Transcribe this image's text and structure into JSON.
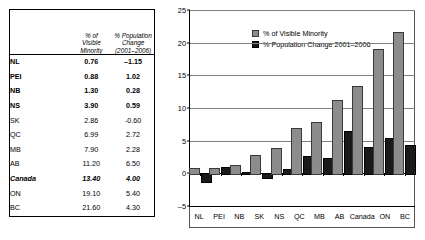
{
  "table": {
    "headers": {
      "name_col": "",
      "col1_lines": [
        "% of",
        "Visible",
        "Minority"
      ],
      "col2_lines": [
        "% Population",
        "Change",
        "(2001–2006)"
      ]
    },
    "rows": [
      {
        "name": "NL",
        "visible_minority": "0.76",
        "population_change": "–1.15",
        "style": "bold"
      },
      {
        "name": "PEI",
        "visible_minority": "0.88",
        "population_change": "1.02",
        "style": "bold"
      },
      {
        "name": "NB",
        "visible_minority": "1.30",
        "population_change": "0.28",
        "style": "bold"
      },
      {
        "name": "NS",
        "visible_minority": "3.90",
        "population_change": "0.59",
        "style": "bold"
      },
      {
        "name": "SK",
        "visible_minority": "2.86",
        "population_change": "-0.60",
        "style": "normal"
      },
      {
        "name": "QC",
        "visible_minority": "6.99",
        "population_change": "2.72",
        "style": "normal"
      },
      {
        "name": "MB",
        "visible_minority": "7.90",
        "population_change": "2.28",
        "style": "normal"
      },
      {
        "name": "AB",
        "visible_minority": "11.20",
        "population_change": "6.50",
        "style": "normal"
      },
      {
        "name": "Canada",
        "visible_minority": "13.40",
        "population_change": "4.00",
        "style": "bolditalic"
      },
      {
        "name": "ON",
        "visible_minority": "19.10",
        "population_change": "5.40",
        "style": "normal"
      },
      {
        "name": "BC",
        "visible_minority": "21.60",
        "population_change": "4.30",
        "style": "normal"
      }
    ]
  },
  "chart_data": {
    "type": "bar",
    "title": "",
    "xlabel": "",
    "ylabel": "",
    "ylim": [
      -5,
      25
    ],
    "yticks": [
      25,
      20,
      15,
      10,
      5,
      0,
      -5
    ],
    "ytick_labels": [
      "25",
      "20",
      "15",
      "10",
      "5",
      "0",
      "–5"
    ],
    "grid": true,
    "legend_position": "top-left",
    "categories": [
      "NL",
      "PEI",
      "NB",
      "SK",
      "NS",
      "QC",
      "MB",
      "AB",
      "Canada",
      "ON",
      "BC"
    ],
    "series": [
      {
        "name": "% of Visible Minority",
        "color": "#8c8c8c",
        "values": [
          0.76,
          0.88,
          1.3,
          2.86,
          3.9,
          6.99,
          7.9,
          11.2,
          13.4,
          19.1,
          21.6
        ]
      },
      {
        "name": "% Population Change 2001–2006",
        "color": "#1a1a1a",
        "values": [
          -1.15,
          1.02,
          0.28,
          -0.6,
          0.59,
          2.72,
          2.28,
          6.5,
          4.0,
          5.4,
          4.3
        ]
      }
    ]
  },
  "colors": {
    "series1": "#8c8c8c",
    "series2": "#1a1a1a",
    "gridline": "#808080",
    "axis": "#000000",
    "background": "#ffffff"
  }
}
